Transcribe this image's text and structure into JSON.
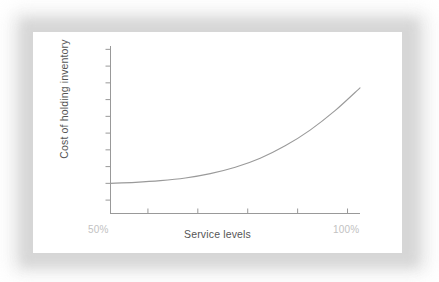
{
  "card": {
    "background": "#ffffff",
    "frame_color": "#dedede"
  },
  "chart_data": {
    "type": "line",
    "title": "",
    "subtitle": "",
    "xlabel": "Service levels",
    "ylabel": "Cost of holding inventory",
    "x_tick_labels": [
      "50%",
      "100%"
    ],
    "y_tick_labels": [],
    "grid": false,
    "legend": null,
    "axis_color": "#999999",
    "tick_color": "#999999",
    "line_color": "#9a9a9a",
    "tick_label_color": "#c2c2c2",
    "axis_title_color": "#555555",
    "xlim": [
      50,
      100
    ],
    "ylim": [
      0,
      100
    ],
    "x_major_ticks": [
      57.5,
      67.5,
      77.5,
      87.5,
      97.5
    ],
    "y_major_ticks": [
      8,
      18,
      28,
      38,
      48,
      58,
      68,
      78,
      88,
      98
    ],
    "series": [
      {
        "name": "Cost of holding inventory",
        "x": [
          50,
          55,
          60,
          65,
          70,
          75,
          80,
          85,
          90,
          95,
          100
        ],
        "y": [
          18,
          18.6,
          19.6,
          21.2,
          23.8,
          27.6,
          33.0,
          40.4,
          49.8,
          61.4,
          75.0
        ]
      }
    ],
    "annotations": []
  },
  "axis": {
    "x_label": "Service levels",
    "y_label": "Cost of holding inventory",
    "x_min_label": "50%",
    "x_max_label": "100%"
  }
}
